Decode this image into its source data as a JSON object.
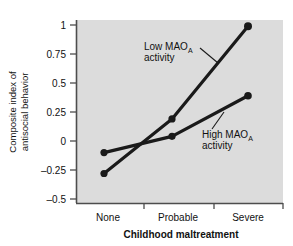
{
  "chart_data": {
    "type": "line",
    "title": "",
    "xlabel": "Childhood maltreatment",
    "ylabel_line1": "Composite index of",
    "ylabel_line2": "antisocial behavior",
    "categories": [
      "None",
      "Probable",
      "Severe"
    ],
    "ytick_labels": [
      "1",
      "0.75",
      "0.5",
      "0.25",
      "0",
      "–0.25",
      "–0.5"
    ],
    "ytick_values": [
      1,
      0.75,
      0.5,
      0.25,
      0,
      -0.25,
      -0.5
    ],
    "ylim": [
      -0.5,
      1
    ],
    "grid": false,
    "legend_position": "inline-annotations",
    "plot_background": "#dcdcdc",
    "line_color": "#1a1a1a",
    "series": [
      {
        "name": "Low MAO_A activity",
        "label_main": "Low MAO",
        "label_sub": "A",
        "label_line2": "activity",
        "values": [
          -0.28,
          0.19,
          0.99
        ]
      },
      {
        "name": "High MAO_A activity",
        "label_main": "High MAO",
        "label_sub": "A",
        "label_line2": "activity",
        "values": [
          -0.1,
          0.04,
          0.39
        ]
      }
    ]
  }
}
